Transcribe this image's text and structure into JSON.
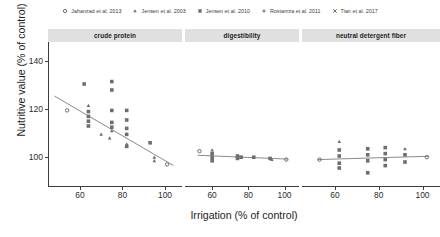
{
  "chart_data": {
    "type": "scatter",
    "title": "",
    "xlabel": "Irrigation (% of control)",
    "ylabel": "Nutritive value (% of control)",
    "xlim": [
      45,
      108
    ],
    "ylim": [
      88,
      148
    ],
    "xticks": [
      60,
      80,
      100
    ],
    "yticks": [
      100,
      120,
      140
    ],
    "grid": false,
    "legend_position": "top",
    "facets": [
      {
        "label": "crude protein",
        "trendline": {
          "x": [
            48,
            104
          ],
          "y": [
            125.5,
            96.5
          ]
        },
        "points": [
          {
            "study": "Jensen et al. 2010",
            "marker": "square",
            "x": 62,
            "y": 130.5
          },
          {
            "study": "Jensen et al. 2010",
            "marker": "square",
            "x": 75,
            "y": 131.5
          },
          {
            "study": "Jensen et al. 2010",
            "marker": "square",
            "x": 75,
            "y": 128.0
          },
          {
            "study": "Jahanzad et al. 2013",
            "marker": "circle",
            "x": 54,
            "y": 119.5
          },
          {
            "study": "Jensen et al. 2003",
            "marker": "triangle",
            "x": 64,
            "y": 121.5
          },
          {
            "study": "Jensen et al. 2010",
            "marker": "square",
            "x": 64,
            "y": 119.0
          },
          {
            "study": "Jensen et al. 2010",
            "marker": "square",
            "x": 64,
            "y": 117.0
          },
          {
            "study": "Jensen et al. 2010",
            "marker": "square",
            "x": 64,
            "y": 115.0
          },
          {
            "study": "Jensen et al. 2010",
            "marker": "square",
            "x": 64,
            "y": 113.0
          },
          {
            "study": "Jensen et al. 2010",
            "marker": "square",
            "x": 75,
            "y": 119.5
          },
          {
            "study": "Jensen et al. 2010",
            "marker": "square",
            "x": 75,
            "y": 114.5
          },
          {
            "study": "Jensen et al. 2010",
            "marker": "square",
            "x": 75,
            "y": 112.5
          },
          {
            "study": "Jensen et al. 2003",
            "marker": "triangle",
            "x": 75,
            "y": 111.0
          },
          {
            "study": "Jensen et al. 2010",
            "marker": "square",
            "x": 82,
            "y": 119.5
          },
          {
            "study": "Jensen et al. 2010",
            "marker": "square",
            "x": 82,
            "y": 115.5
          },
          {
            "study": "Jensen et al. 2010",
            "marker": "square",
            "x": 82,
            "y": 112.0
          },
          {
            "study": "Jensen et al. 2010",
            "marker": "square",
            "x": 82,
            "y": 109.5
          },
          {
            "study": "Jensen et al. 2003",
            "marker": "triangle",
            "x": 70,
            "y": 109.5
          },
          {
            "study": "Jensen et al. 2003",
            "marker": "triangle",
            "x": 74,
            "y": 108.0
          },
          {
            "study": "Jensen et al. 2003",
            "marker": "triangle",
            "x": 82,
            "y": 105.5
          },
          {
            "study": "Jensen et al. 2010",
            "marker": "square",
            "x": 82,
            "y": 104.5
          },
          {
            "study": "Jensen et al. 2010",
            "marker": "square",
            "x": 93,
            "y": 106.0
          },
          {
            "study": "Jensen et al. 2003",
            "marker": "triangle",
            "x": 95,
            "y": 100.0
          },
          {
            "study": "Jensen et al. 2003",
            "marker": "triangle",
            "x": 95,
            "y": 98.5
          },
          {
            "study": "Jahanzad et al. 2013",
            "marker": "circle",
            "x": 101,
            "y": 97.0
          }
        ]
      },
      {
        "label": "digestibility",
        "trendline": {
          "x": [
            52,
            102
          ],
          "y": [
            100.8,
            99.2
          ]
        },
        "points": [
          {
            "study": "Jahanzad et al. 2013",
            "marker": "circle",
            "x": 53,
            "y": 102.5
          },
          {
            "study": "Jensen et al. 2010",
            "marker": "square",
            "x": 60,
            "y": 101.5
          },
          {
            "study": "Jensen et al. 2010",
            "marker": "square",
            "x": 60,
            "y": 100.0
          },
          {
            "study": "Jensen et al. 2010",
            "marker": "square",
            "x": 60,
            "y": 98.5
          },
          {
            "study": "Jensen et al. 2003",
            "marker": "triangle",
            "x": 60,
            "y": 103.0
          },
          {
            "study": "Jensen et al. 2010",
            "marker": "square",
            "x": 74,
            "y": 100.5
          },
          {
            "study": "Jensen et al. 2010",
            "marker": "square",
            "x": 74,
            "y": 99.5
          },
          {
            "study": "Jensen et al. 2010",
            "marker": "square",
            "x": 76,
            "y": 100.0
          },
          {
            "study": "Jensen et al. 2010",
            "marker": "square",
            "x": 83,
            "y": 100.0
          },
          {
            "study": "Jensen et al. 2010",
            "marker": "square",
            "x": 92,
            "y": 99.5
          },
          {
            "study": "Jensen et al. 2003",
            "marker": "triangle",
            "x": 93,
            "y": 99.0
          },
          {
            "study": "Jahanzad et al. 2013",
            "marker": "circle",
            "x": 101,
            "y": 99.0
          }
        ]
      },
      {
        "label": "neutral detergent fiber",
        "trendline": {
          "x": [
            52,
            103
          ],
          "y": [
            99.0,
            100.4
          ]
        },
        "points": [
          {
            "study": "Jahanzad et al. 2013",
            "marker": "circle",
            "x": 53,
            "y": 99.0
          },
          {
            "study": "Jensen et al. 2003",
            "marker": "triangle",
            "x": 62,
            "y": 106.5
          },
          {
            "study": "Jensen et al. 2010",
            "marker": "square",
            "x": 62,
            "y": 103.0
          },
          {
            "study": "Jensen et al. 2010",
            "marker": "square",
            "x": 62,
            "y": 100.5
          },
          {
            "study": "Jensen et al. 2010",
            "marker": "square",
            "x": 62,
            "y": 97.5
          },
          {
            "study": "Jensen et al. 2010",
            "marker": "square",
            "x": 62,
            "y": 95.5
          },
          {
            "study": "Jensen et al. 2010",
            "marker": "square",
            "x": 75,
            "y": 103.5
          },
          {
            "study": "Jensen et al. 2010",
            "marker": "square",
            "x": 75,
            "y": 101.0
          },
          {
            "study": "Jensen et al. 2010",
            "marker": "square",
            "x": 75,
            "y": 98.5
          },
          {
            "study": "Jensen et al. 2010",
            "marker": "square",
            "x": 75,
            "y": 93.5
          },
          {
            "study": "Jensen et al. 2010",
            "marker": "square",
            "x": 83,
            "y": 104.0
          },
          {
            "study": "Jensen et al. 2010",
            "marker": "square",
            "x": 83,
            "y": 101.5
          },
          {
            "study": "Jensen et al. 2010",
            "marker": "square",
            "x": 83,
            "y": 99.0
          },
          {
            "study": "Jensen et al. 2010",
            "marker": "square",
            "x": 83,
            "y": 96.5
          },
          {
            "study": "Jensen et al. 2003",
            "marker": "triangle",
            "x": 92,
            "y": 103.5
          },
          {
            "study": "Jensen et al. 2010",
            "marker": "square",
            "x": 92,
            "y": 101.0
          },
          {
            "study": "Jensen et al. 2010",
            "marker": "square",
            "x": 92,
            "y": 98.0
          },
          {
            "study": "Jahanzad et al. 2013",
            "marker": "circle",
            "x": 102,
            "y": 100.0
          }
        ]
      }
    ]
  },
  "legend": {
    "items": [
      {
        "label": "Jahanzad et al. 2013",
        "marker": "circle"
      },
      {
        "label": "Jensen et al. 2003",
        "marker": "triangle"
      },
      {
        "label": "Jensen et al. 2010",
        "marker": "square"
      },
      {
        "label": "Rostamza et al. 2011",
        "marker": "plus"
      },
      {
        "label": "Tian et al. 2017",
        "marker": "cross"
      }
    ]
  },
  "style": {
    "point_color": "#6e6e6e",
    "trend_color": "#8a8a8a",
    "strip_bg": "#e0e0e0",
    "axis_color": "#3d3d3d"
  }
}
